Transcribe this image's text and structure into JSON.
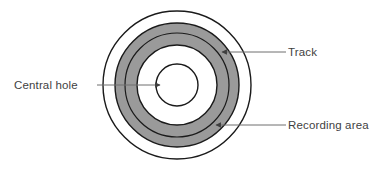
{
  "diagram": {
    "type": "concentric-ring-schematic",
    "background_color": "#ffffff",
    "stroke_color": "#1a1a1a",
    "ring_fill_color": "#9a9a9a",
    "hole_fill_color": "#ffffff",
    "leader_line_color": "#6e6e6e",
    "center": {
      "x": 177,
      "y": 85
    },
    "circles": [
      {
        "name": "disc-outer-edge",
        "radius": 74,
        "fill": "#ffffff"
      },
      {
        "name": "recording-area-outer-edge",
        "radius": 62,
        "fill": "#9a9a9a"
      },
      {
        "name": "track-circle",
        "radius": 52,
        "fill": "#9a9a9a"
      },
      {
        "name": "recording-area-inner-edge",
        "radius": 40,
        "fill": "#ffffff"
      },
      {
        "name": "central-hole",
        "radius": 21,
        "fill": "#ffffff"
      }
    ]
  },
  "labels": {
    "central_hole": "Central hole",
    "track": "Track",
    "recording_area": "Recording area"
  },
  "label_positions": {
    "central_hole": {
      "text_x": 14,
      "text_y": 89,
      "line_x1": 97,
      "line_y1": 85,
      "line_x2": 160,
      "line_y2": 85
    },
    "track": {
      "text_x": 288,
      "text_y": 56,
      "line_x1": 286,
      "line_y1": 52,
      "line_x2": 222,
      "line_y2": 52
    },
    "recording_area": {
      "text_x": 288,
      "text_y": 129,
      "line_x1": 286,
      "line_y1": 125,
      "line_x2": 216,
      "line_y2": 125
    }
  }
}
